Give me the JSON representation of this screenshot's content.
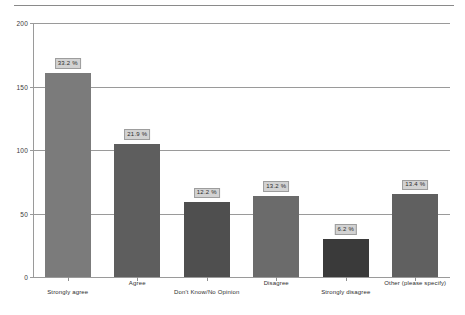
{
  "chart_data": {
    "type": "bar",
    "title": "",
    "subtitle": "",
    "xlabel": "",
    "ylabel": "",
    "ylim": [
      0,
      200
    ],
    "yticks": [
      "0",
      "50",
      "100",
      "150",
      "200"
    ],
    "ytick_values": [
      0,
      50,
      100,
      150,
      200
    ],
    "grid": true,
    "legend": false,
    "categories": [
      "Strongly agree",
      "Agree",
      "Don't Know/No Opinion",
      "Disagree",
      "Strongly disagree",
      "Other (please specify)"
    ],
    "values": [
      161,
      105,
      59,
      64,
      30,
      65
    ],
    "data_labels": [
      "33.2 %",
      "21.9 %",
      "12.2 %",
      "13.2 %",
      "6.2 %",
      "13.4 %"
    ],
    "percentages": [
      33.2,
      21.9,
      12.2,
      13.2,
      6.2,
      13.4
    ],
    "bar_colors": [
      "#7b7b7b",
      "#5e5e5e",
      "#4f4f4f",
      "#6b6b6b",
      "#3a3a3a",
      "#606060"
    ]
  },
  "colors": {
    "background": "#ffffff",
    "grid": "#9a9a9a",
    "axis": "#9a9a9a",
    "rule": "#8a8a8a",
    "label_box_fill": "#d2d2d2",
    "label_box_border": "#9d9d9d",
    "text": "#2d2d2d"
  }
}
